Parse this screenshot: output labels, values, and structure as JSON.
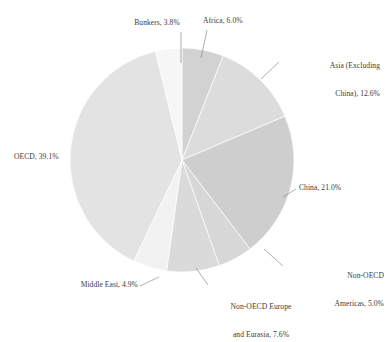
{
  "chart_data": {
    "type": "pie",
    "title": "",
    "subtitle": "",
    "xlabel": "",
    "ylabel": "",
    "legend_position": "none",
    "grid": false,
    "units": "percent",
    "start_angle_deg": 0,
    "direction": "clockwise",
    "categories": [
      "Africa",
      "Asia (Excluding China)",
      "China",
      "Non-OECD Americas",
      "Non-OECD Europe and Eurasia",
      "Middle East",
      "OECD",
      "Bunkers"
    ],
    "values": [
      6.0,
      12.6,
      21.0,
      5.0,
      7.6,
      4.9,
      39.1,
      3.8
    ],
    "slices": [
      {
        "name": "Africa",
        "value": 6.0,
        "label": "Africa, 6.0%",
        "color": "#d2d2d2"
      },
      {
        "name": "Asia (Excluding China)",
        "value": 12.6,
        "label_line1": "Asia (Excluding",
        "label_line2": "China), 12.6%",
        "color": "#dcdcdc"
      },
      {
        "name": "China",
        "value": 21.0,
        "label": "China, 21.0%",
        "color": "#cecece"
      },
      {
        "name": "Non-OECD Americas",
        "value": 5.0,
        "label_line1": "Non-OECD",
        "label_line2": "Americas, 5.0%",
        "color": "#d7d7d7"
      },
      {
        "name": "Non-OECD Europe and Eurasia",
        "value": 7.6,
        "label_line1": "Non-OECD Europe",
        "label_line2": "and Eurasia, 7.6%",
        "color": "#dadada"
      },
      {
        "name": "Middle East",
        "value": 4.9,
        "label": "Middle East, 4.9%",
        "color": "#f2f2f2"
      },
      {
        "name": "OECD",
        "value": 39.1,
        "label": "OECD, 39.1%",
        "color": "#e3e3e3"
      },
      {
        "name": "Bunkers",
        "value": 3.8,
        "label": "Bunkers, 3.8%",
        "color": "#f6f6f6"
      }
    ]
  },
  "labels": {
    "bunkers": "Bunkers, 3.8%",
    "africa": "Africa, 6.0%",
    "asia_l1": "Asia (Excluding",
    "asia_l2": "China), 12.6%",
    "china": "China, 21.0%",
    "non_oecd_americas_l1": "Non-OECD",
    "non_oecd_americas_l2": "Americas, 5.0%",
    "non_oecd_europe_l1": "Non-OECD Europe",
    "non_oecd_europe_l2": "and Eurasia, 7.6%",
    "middle_east": "Middle East, 4.9%",
    "oecd": "OECD, 39.1%"
  },
  "colors": {
    "background": "#ffffff",
    "text": "#3c3c3c",
    "leader_line": "#8c8c8c"
  }
}
